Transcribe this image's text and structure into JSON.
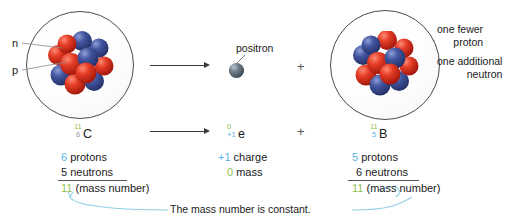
{
  "diagram": {
    "colors": {
      "proton": "#d02a20",
      "neutron": "#3d4e96",
      "positron": "#5b6b78",
      "accent_blue": "#5bb4e5",
      "accent_green": "#8fbf52",
      "line": "#3a3a3a",
      "connector": "#8fd0e8"
    },
    "left_atom": {
      "name": "carbon-11-atom",
      "labels": {
        "neutron": "n",
        "proton": "p"
      },
      "isotope": {
        "mass_number": "11",
        "atomic_number": "6",
        "symbol": "C"
      },
      "tally": {
        "protons_count": "6",
        "protons_label": "protons",
        "neutrons_count": "5",
        "neutrons_label": "neutrons",
        "total_count": "11",
        "total_label": "(mass number)"
      }
    },
    "emitted": {
      "name": "positron",
      "label": "positron",
      "isotope": {
        "mass_number": "0",
        "charge_number": "+1",
        "symbol": "e"
      },
      "tally": {
        "charge_value": "+1",
        "charge_label": "charge",
        "mass_value": "0",
        "mass_label": "mass"
      }
    },
    "right_atom": {
      "name": "boron-11-atom",
      "labels": {
        "fewer_proton_line1": "one fewer",
        "fewer_proton_line2": "proton",
        "additional_neutron_line1": "one additional",
        "additional_neutron_line2": "neutron"
      },
      "isotope": {
        "mass_number": "11",
        "atomic_number": "5",
        "symbol": "B"
      },
      "tally": {
        "protons_count": "5",
        "protons_label": "protons",
        "neutrons_count": "6",
        "neutrons_label": "neutrons",
        "total_count": "11",
        "total_label": "(mass number)"
      }
    },
    "operators": {
      "plus_top": "+",
      "plus_bottom": "+"
    },
    "caption": "The mass number is constant."
  }
}
